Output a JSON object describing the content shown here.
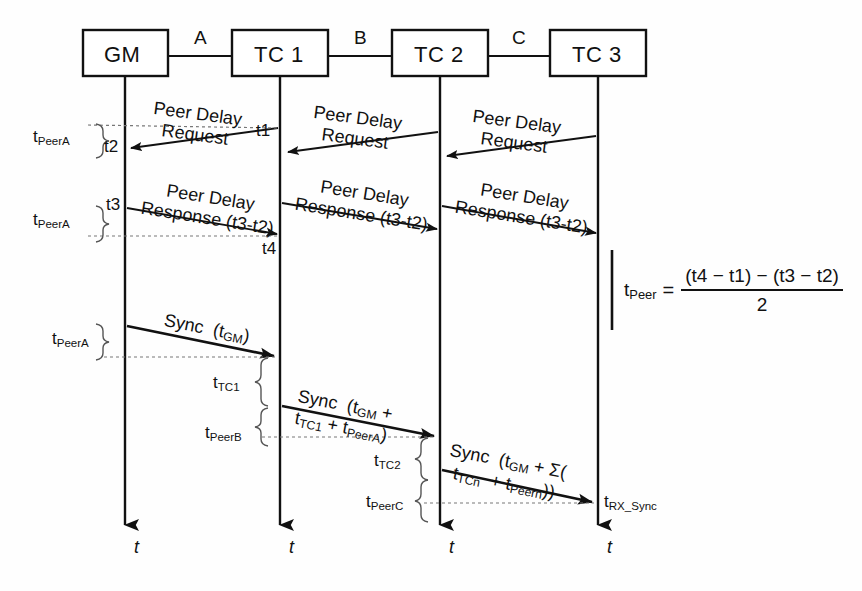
{
  "diagram": {
    "nodes": [
      {
        "id": "gm",
        "label": "GM"
      },
      {
        "id": "tc1",
        "label": "TC 1"
      },
      {
        "id": "tc2",
        "label": "TC 2"
      },
      {
        "id": "tc3",
        "label": "TC 3"
      }
    ],
    "links": [
      {
        "id": "a",
        "label": "A"
      },
      {
        "id": "b",
        "label": "B"
      },
      {
        "id": "c",
        "label": "C"
      }
    ],
    "peer_delay_request": {
      "line1": "Peer Delay",
      "line2": "Request",
      "count": 3,
      "direction": "right-to-left"
    },
    "peer_delay_response": {
      "line1": "Peer Delay",
      "line2": "Response (t3-t2)",
      "count": 3,
      "direction": "left-to-right"
    },
    "sync_messages": [
      {
        "id": "sync1",
        "line1": "Sync  (t",
        "line1_sub": "GM",
        "line1_end": ")",
        "text": "Sync (tGM)"
      },
      {
        "id": "sync2",
        "text": "Sync (tGM + tTC1 + tPeerA)"
      },
      {
        "id": "sync3",
        "text": "Sync (tGM + Σ( tTCn + tPeern))"
      }
    ],
    "timestamps": [
      {
        "id": "t1",
        "label": "t1"
      },
      {
        "id": "t2",
        "label": "t2"
      },
      {
        "id": "t3",
        "label": "t3"
      },
      {
        "id": "t4",
        "label": "t4"
      }
    ],
    "brace_labels": [
      {
        "id": "peerA-1",
        "base": "t",
        "sub": "PeerA"
      },
      {
        "id": "peerA-2",
        "base": "t",
        "sub": "PeerA"
      },
      {
        "id": "peerA-3",
        "base": "t",
        "sub": "PeerA"
      },
      {
        "id": "tc1-res",
        "base": "t",
        "sub": "TC1"
      },
      {
        "id": "peerB",
        "base": "t",
        "sub": "PeerB"
      },
      {
        "id": "tc2-res",
        "base": "t",
        "sub": "TC2"
      },
      {
        "id": "peerC",
        "base": "t",
        "sub": "PeerC"
      }
    ],
    "rx_sync_label": {
      "base": "t",
      "sub": "RX_Sync"
    },
    "axis_label": "t",
    "equation": {
      "lhs_base": "t",
      "lhs_sub": "Peer",
      "eq_sign": "=",
      "numerator": "(t4 − t1) − (t3 − t2)",
      "denominator": "2"
    },
    "colors": {
      "stroke": "#111111",
      "background": "#ffffff",
      "dashed": "#777777"
    }
  }
}
